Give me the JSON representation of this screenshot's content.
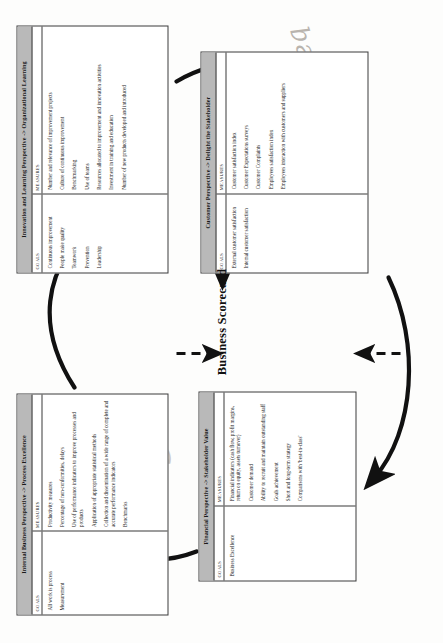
{
  "diagram": {
    "title": "Business Scorecard",
    "center_label": "Business Scorecard",
    "column_headers": {
      "goals": "GOALS",
      "measures": "MEASURES"
    },
    "arrow_style": "clockwise-cycle",
    "colors": {
      "title_bar": "#b9b9b9",
      "border": "#3a3a3a",
      "background": "#ffffff",
      "text": "#222222",
      "ink_annotation": "#b9b4ae"
    },
    "perspectives": [
      {
        "id": "internal-business",
        "title": "Internal Business Perspective -> Process Excellence",
        "goals": [
          "All work is process",
          "Measurement"
        ],
        "measures": [
          "Productivity measures",
          "Percentage of non-conformities, delays",
          "Use of performance indicators to improve processes and products",
          "Application of appropriate statistical methods",
          "Collection and dissemination of a wide range of complete and accurate performance indicators",
          "Benchmarks"
        ]
      },
      {
        "id": "innovation-learning",
        "title": "Innovation and Learning Perspective -> Organizational Learning",
        "goals": [
          "Continuous improvement",
          "People make quality",
          "Teamwork",
          "Prevention",
          "Leadership"
        ],
        "measures": [
          "Number and relevance of improvement projects",
          "Culture of continuous improvement",
          "Benchmarking",
          "Use of teams",
          "Resources allocated to improvement and innovation activities",
          "Investment in training and education",
          "Number of new products developed and introduced"
        ]
      },
      {
        "id": "financial",
        "title": "Financial Perspective -> Stakeholder Value",
        "goals": [
          "Business Excellence"
        ],
        "measures": [
          "Financial indicators (cash flow, profit margins, return on equity, assets turnover)",
          "Customer demand",
          "Ability to recruit and maintain outstanding staff",
          "Goals achievement",
          "Short and long-term strategy",
          "Comparisons with 'best-in-class'"
        ]
      },
      {
        "id": "customer",
        "title": "Customer Perspective -> Delight the Stakeholder",
        "goals": [
          "External customer satisfaction",
          "Internal customer satisfaction"
        ],
        "measures": [
          "Customer satisfaction index",
          "Customer Expectations surveys",
          "Customer Complaints",
          "Employees satisfaction index",
          "Employees interaction with customers and suppliers"
        ]
      }
    ],
    "annotations": [
      {
        "text": "Bulanceq",
        "note": "faint handwritten pencil scrawl, upper right"
      },
      {
        "text": "Sc",
        "note": "faint handwritten pencil scrawl, lower right"
      }
    ]
  }
}
